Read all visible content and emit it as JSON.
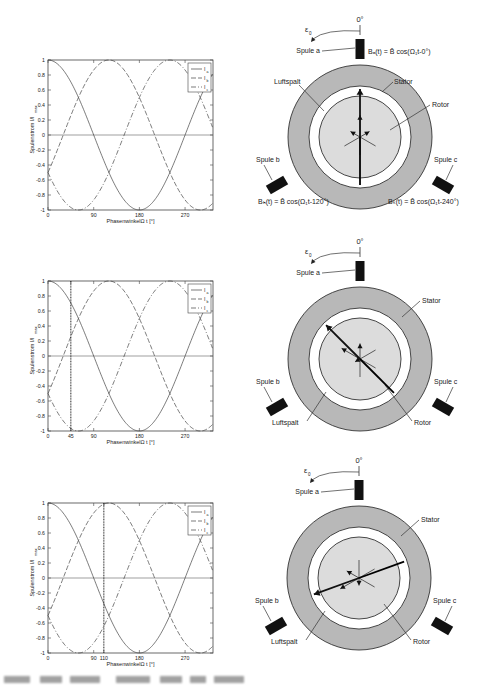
{
  "figure": {
    "panels": [
      {
        "id": "top",
        "plot": {
          "ylabel": "Spulenstrom I/I",
          "ylabel_sub": "max",
          "xlabel": "PhasenwinkelΩ t [°]",
          "xticks": [
            "0",
            "90",
            "180",
            "270"
          ],
          "yticks": [
            "1",
            "0.8",
            "0.6",
            "0.4",
            "0.2",
            "0",
            "-0.2",
            "-0.4",
            "-0.6",
            "-0.8",
            "-1"
          ],
          "marker_deg": null,
          "marker_label": null
        },
        "motor": {
          "angle_label": "0°",
          "epsilon_label": "ε",
          "epsilon_sub": "0",
          "labels": {
            "spule_a": "Spule a",
            "spule_b": "Spule b",
            "spule_c": "Spule c",
            "stator": "Stator",
            "rotor": "Rotor",
            "luftspalt": "Luftspalt"
          },
          "formulas": {
            "a": "Bₐ(t) = B̂ cos(Ω₁t-0°)",
            "b": "Bₕ(t) = B̂ cos(Ω₁t-120°)",
            "c": "Bₖ(t) = B̂ cos(Ω₁t-240°)"
          },
          "field_angle_deg": 0
        }
      },
      {
        "id": "middle",
        "plot": {
          "ylabel": "Spulenstrom I/I",
          "ylabel_sub": "max",
          "xlabel": "PhasenwinkelΩ t [°]",
          "xticks": [
            "0",
            "45",
            "90",
            "180",
            "270"
          ],
          "yticks": [
            "1",
            "0.8",
            "0.6",
            "0.4",
            "0.2",
            "0",
            "-0.2",
            "-0.4",
            "-0.6",
            "-0.8",
            "-1"
          ],
          "marker_deg": 45,
          "marker_label": "45"
        },
        "motor": {
          "angle_label": "0°",
          "epsilon_label": "ε",
          "epsilon_sub": "0",
          "labels": {
            "spule_a": "Spule a",
            "spule_b": "Spule b",
            "spule_c": "Spule c",
            "stator": "Stator",
            "rotor": "Rotor",
            "luftspalt": "Luftspalt"
          },
          "field_angle_deg": 45
        }
      },
      {
        "id": "bottom",
        "plot": {
          "ylabel": "Spulenstrom I/I",
          "ylabel_sub": "max",
          "xlabel": "PhasenwinkelΩ t [°]",
          "xticks": [
            "0",
            "90",
            "110",
            "180",
            "270"
          ],
          "yticks": [
            "1",
            "0.8",
            "0.6",
            "0.4",
            "0.2",
            "0",
            "-0.2",
            "-0.4",
            "-0.6",
            "-0.8",
            "-1"
          ],
          "marker_deg": 110,
          "marker_label": "110"
        },
        "motor": {
          "angle_label": "0°",
          "epsilon_label": "ε",
          "epsilon_sub": "0",
          "labels": {
            "spule_a": "Spule a",
            "spule_b": "Spule b",
            "spule_c": "Spule c",
            "stator": "Stator",
            "rotor": "Rotor",
            "luftspalt": "Luftspalt"
          },
          "field_angle_deg": 110
        }
      }
    ],
    "legend": [
      {
        "label": "I",
        "sub": "a",
        "style": "solid"
      },
      {
        "label": "I",
        "sub": "b",
        "style": "dashed"
      },
      {
        "label": "I",
        "sub": "c",
        "style": "dashdot"
      }
    ]
  },
  "chart_data": [
    {
      "type": "line",
      "title": "",
      "xlabel": "Phasenwinkel Ω t [°]",
      "ylabel": "Spulenstrom I/I_max",
      "xlim": [
        0,
        325
      ],
      "ylim": [
        -1,
        1
      ],
      "xticks": [
        0,
        90,
        180,
        270
      ],
      "legend_position": "upper right",
      "grid": false,
      "series": [
        {
          "name": "I_a",
          "formula": "cos(x)",
          "x": [
            0,
            45,
            90,
            135,
            180,
            225,
            270,
            315
          ],
          "values": [
            1,
            0.71,
            0,
            -0.71,
            -1,
            -0.71,
            0,
            0.71
          ]
        },
        {
          "name": "I_b",
          "formula": "cos(x-120)",
          "x": [
            0,
            45,
            90,
            135,
            180,
            225,
            270,
            315
          ],
          "values": [
            -0.5,
            0.26,
            0.87,
            0.97,
            0.5,
            -0.26,
            -0.87,
            -0.97
          ]
        },
        {
          "name": "I_c",
          "formula": "cos(x-240)",
          "x": [
            0,
            45,
            90,
            135,
            180,
            225,
            270,
            315
          ],
          "values": [
            -0.5,
            -0.97,
            -0.87,
            -0.26,
            0.5,
            0.97,
            0.87,
            0.26
          ]
        }
      ],
      "marker_x": null
    },
    {
      "type": "line",
      "xlabel": "Phasenwinkel Ω t [°]",
      "ylabel": "Spulenstrom I/I_max",
      "xlim": [
        0,
        325
      ],
      "ylim": [
        -1,
        1
      ],
      "xticks": [
        0,
        45,
        90,
        180,
        270
      ],
      "legend_position": "upper right",
      "series": [
        {
          "name": "I_a",
          "formula": "cos(x)"
        },
        {
          "name": "I_b",
          "formula": "cos(x-120)"
        },
        {
          "name": "I_c",
          "formula": "cos(x-240)"
        }
      ],
      "marker_x": 45
    },
    {
      "type": "line",
      "xlabel": "Phasenwinkel Ω t [°]",
      "ylabel": "Spulenstrom I/I_max",
      "xlim": [
        0,
        325
      ],
      "ylim": [
        -1,
        1
      ],
      "xticks": [
        0,
        90,
        110,
        180,
        270
      ],
      "legend_position": "upper right",
      "series": [
        {
          "name": "I_a",
          "formula": "cos(x)"
        },
        {
          "name": "I_b",
          "formula": "cos(x-120)"
        },
        {
          "name": "I_c",
          "formula": "cos(x-240)"
        }
      ],
      "marker_x": 110
    }
  ]
}
